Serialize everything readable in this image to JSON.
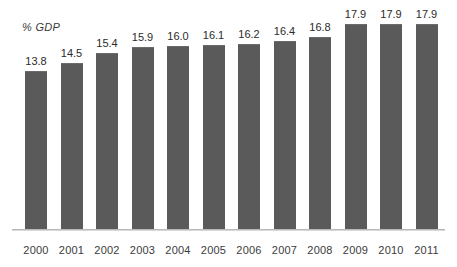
{
  "chart_data": {
    "type": "bar",
    "title": "",
    "subtitle": "",
    "ylabel": "% GDP",
    "xlabel": "",
    "categories": [
      "2000",
      "2001",
      "2002",
      "2003",
      "2004",
      "2005",
      "2006",
      "2007",
      "2008",
      "2009",
      "2010",
      "2011"
    ],
    "values": [
      13.8,
      14.5,
      15.4,
      15.9,
      16.0,
      16.1,
      16.2,
      16.4,
      16.8,
      17.9,
      17.9,
      17.9
    ],
    "value_labels": [
      "13.8",
      "14.5",
      "15.4",
      "15.9",
      "16.0",
      "16.1",
      "16.2",
      "16.4",
      "16.8",
      "17.9",
      "17.9",
      "17.9"
    ],
    "tick_labels": [
      "2000",
      "2001",
      "2002",
      "2003",
      "2004",
      "2005",
      "2006",
      "2007",
      "2008",
      "2009",
      "2010",
      "2011"
    ],
    "ylim": [
      0,
      20.5
    ],
    "grid": false,
    "legend": null,
    "legend_position": "none",
    "data_labels_shown": true,
    "y_axis_visible": false,
    "x_axis_visible": true,
    "series": [
      {
        "name": "% GDP",
        "values": [
          13.8,
          14.5,
          15.4,
          15.9,
          16.0,
          16.1,
          16.2,
          16.4,
          16.8,
          17.9,
          17.9,
          17.9
        ],
        "color": "#5a5a5a"
      }
    ],
    "colors": {
      "bar": "#5a5a5a",
      "axis": "#b9b9b9",
      "value_text": "#2b2b2b",
      "tick_text": "#3b3b3b",
      "axis_label_text": "#3a3a3a",
      "background": "#ffffff"
    }
  }
}
